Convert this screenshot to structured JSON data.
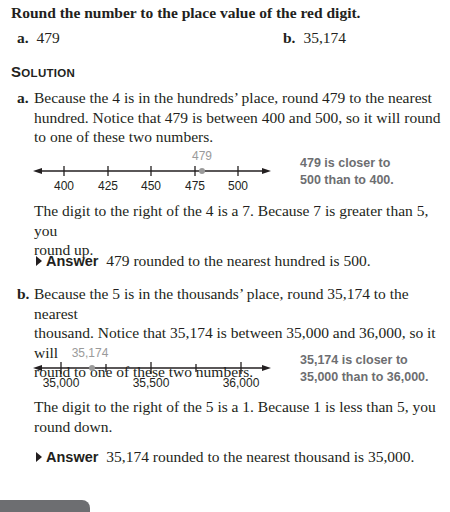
{
  "prompt": "Round the number to the place value of the red digit.",
  "problems": [
    {
      "label": "a.",
      "value": "479"
    },
    {
      "label": "b.",
      "value": "35,174"
    }
  ],
  "solution_heading": "SOLUTION",
  "parts": [
    {
      "label": "a.",
      "intro_lines": [
        "Because the 4 is in the hundreds’ place, round 479 to the nearest",
        "hundred. Notice that 479 is between 400 and 500, so it will round",
        "to one of these two numbers."
      ],
      "number_line": {
        "ticks": [
          "400",
          "425",
          "450",
          "475",
          "500"
        ],
        "point_label": "479",
        "note_lines": [
          "479 is closer to",
          "500 than to 400."
        ]
      },
      "explain_lines": [
        "The digit to the right of the 4 is a 7. Because 7 is greater than 5, you",
        "round up."
      ],
      "answer_tag": "Answer",
      "answer_text": "479 rounded to the nearest hundred is 500."
    },
    {
      "label": "b.",
      "intro_lines": [
        "Because the 5 is in the thousands’ place, round 35,174 to the nearest",
        "thousand. Notice that 35,174 is between 35,000 and 36,000, so it will",
        "round to one of these two numbers."
      ],
      "number_line": {
        "ticks": [
          "35,000",
          "35,500",
          "36,000"
        ],
        "point_label": "35,174",
        "note_lines": [
          "35,174 is closer to",
          "35,000 than to 36,000."
        ]
      },
      "explain_lines": [
        "The digit to the right of the 5 is a 1. Because 1 is less than 5, you",
        "round down."
      ],
      "answer_tag": "Answer",
      "answer_text": "35,174 rounded to the nearest thousand is 35,000."
    }
  ],
  "colors": {
    "text": "#231f20",
    "note_gray": "#6d6e71",
    "point_gray": "#9a9a9a"
  }
}
